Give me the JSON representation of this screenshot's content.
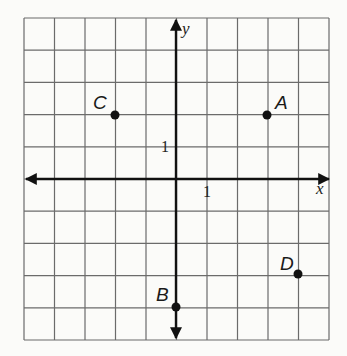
{
  "chart_data": {
    "type": "scatter",
    "title": "",
    "xlabel": "x",
    "ylabel": "y",
    "xlim": [
      -5,
      5
    ],
    "ylim": [
      -5,
      5
    ],
    "grid": true,
    "tick_labels": {
      "x": [
        "1"
      ],
      "y": [
        "1"
      ]
    },
    "points": [
      {
        "label": "A",
        "x": 3,
        "y": 2
      },
      {
        "label": "B",
        "x": 0,
        "y": -4
      },
      {
        "label": "C",
        "x": -2,
        "y": 2
      },
      {
        "label": "D",
        "x": 4,
        "y": -3
      }
    ]
  },
  "labels": {
    "x_axis": "x",
    "y_axis": "y",
    "x_tick": "1",
    "y_tick": "1",
    "point_a": "A",
    "point_b": "B",
    "point_c": "C",
    "point_d": "D"
  }
}
